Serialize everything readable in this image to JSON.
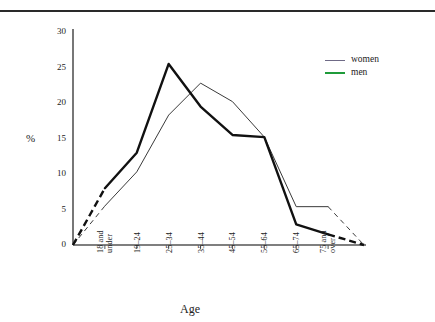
{
  "figure": {
    "has_top_rule": true,
    "rule_color": "#2a2a2a"
  },
  "axis": {
    "y_label": "%",
    "x_label": "Age",
    "y_ticks": [
      "30",
      "25",
      "20",
      "15",
      "10",
      "5",
      "0"
    ],
    "y_min": 0,
    "y_max": 30,
    "axis_color": "#555555"
  },
  "legend": {
    "items": [
      {
        "label": "women",
        "color": "#6f6a86",
        "style": "thin"
      },
      {
        "label": "men",
        "color": "#1f9b3a",
        "style": "thick"
      }
    ]
  },
  "chart_data": {
    "type": "line",
    "title": "",
    "subtitle": "",
    "xlabel": "Age",
    "ylabel": "%",
    "ylim": [
      0,
      30
    ],
    "yticks": [
      0,
      5,
      10,
      15,
      20,
      25,
      30
    ],
    "grid": false,
    "legend_position": "top-right",
    "categories": [
      "18 and under",
      "19–24",
      "25–34",
      "35–44",
      "45–54",
      "55–64",
      "65–74",
      "75 and over"
    ],
    "category_lines": [
      [
        "18 and",
        "under"
      ],
      [
        "19–24"
      ],
      [
        "25–34"
      ],
      [
        "35–44"
      ],
      [
        "45–54"
      ],
      [
        "55–64"
      ],
      [
        "65–74"
      ],
      [
        "75 and",
        "over"
      ]
    ],
    "series": [
      {
        "name": "women",
        "color": "#3a3a3a",
        "line_width": 1,
        "values": [
          5.5,
          10.3,
          18.3,
          22.8,
          20.2,
          15.2,
          5.4,
          5.4
        ],
        "leading_dashed_segment": {
          "from_value": 0,
          "to_value": 5.5
        },
        "trailing_dashed_segment": {
          "from_value": 5.4,
          "to_value": 0
        }
      },
      {
        "name": "men",
        "color": "#111111",
        "line_width": 2.4,
        "values": [
          8.0,
          13.0,
          25.5,
          19.5,
          15.5,
          15.2,
          2.9,
          1.5
        ],
        "leading_dashed_segment": {
          "from_value": 0,
          "to_value": 8.0
        },
        "trailing_dashed_segment": {
          "from_value": 1.5,
          "to_value": 0
        }
      }
    ]
  }
}
